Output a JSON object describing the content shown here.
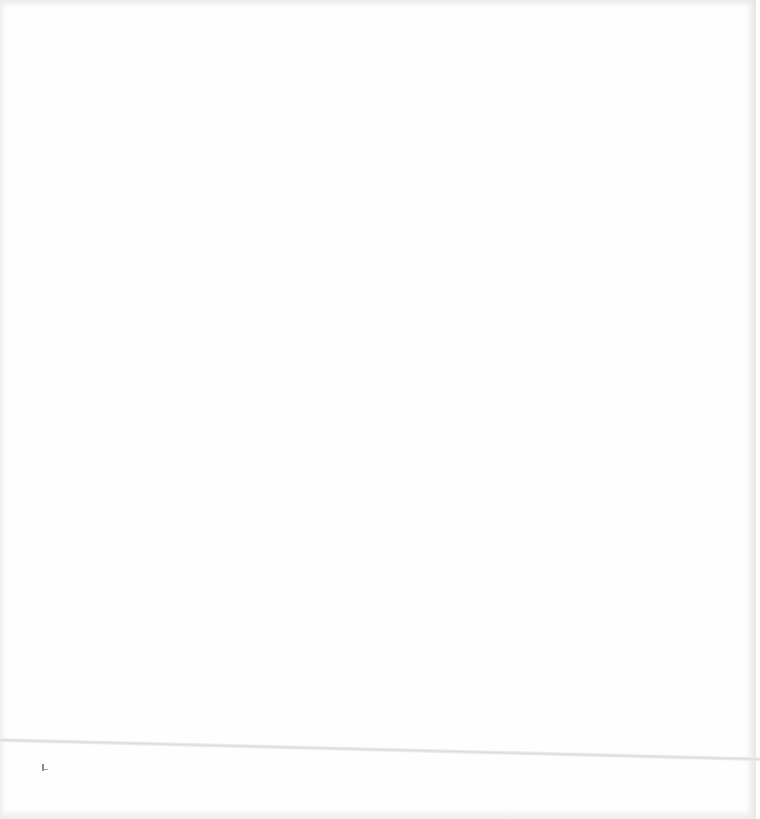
{
  "document": {
    "type": "blank-scanned-page",
    "background_color": "#fefefe",
    "rule_color": "#dcdcdc",
    "mark_color": "#8a8a8a",
    "text": ""
  }
}
